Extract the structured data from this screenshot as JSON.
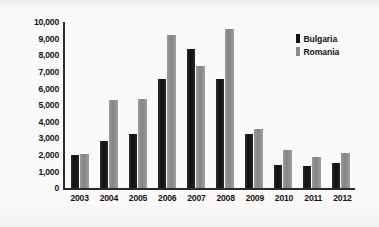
{
  "chart_data": {
    "type": "bar",
    "title": "",
    "xlabel": "",
    "ylabel": "Foreign Direct Investment (millions of euros)",
    "categories": [
      "2003",
      "2004",
      "2005",
      "2006",
      "2007",
      "2008",
      "2009",
      "2010",
      "2011",
      "2012"
    ],
    "series": [
      {
        "name": "Bulgaria",
        "color": "#141414",
        "values": [
          1980,
          2850,
          3300,
          6550,
          8400,
          6550,
          3250,
          1420,
          1350,
          1500
        ]
      },
      {
        "name": "Romania",
        "color": "#8c8c8c",
        "values": [
          2050,
          5300,
          5350,
          9200,
          7350,
          9600,
          3550,
          2280,
          1880,
          2150
        ]
      }
    ],
    "ylim": [
      0,
      10000
    ],
    "yticks": [
      10000,
      9000,
      8000,
      7000,
      6000,
      5000,
      4000,
      3000,
      2000,
      1000,
      0
    ],
    "ytick_labels": [
      "10,000",
      "9,000",
      "8,000",
      "7,000",
      "6,000",
      "5,000",
      "4,000",
      "3,000",
      "2,000",
      "1,000",
      "0"
    ],
    "grid": false,
    "legend_position": "top-right"
  },
  "legend": {
    "entries": [
      {
        "label": "Bulgaria"
      },
      {
        "label": "Romania"
      }
    ]
  }
}
